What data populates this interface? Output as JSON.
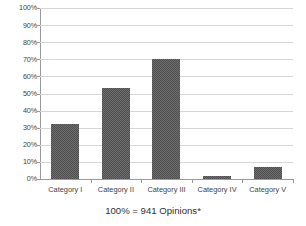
{
  "chart_data": {
    "type": "bar",
    "title": "",
    "subtitle": "",
    "xlabel": "",
    "ylabel": "",
    "categories": [
      "Category I",
      "Category II",
      "Category III",
      "Category IV",
      "Category V"
    ],
    "values": [
      32,
      53.5,
      70,
      1.5,
      7
    ],
    "value_labels": [
      "32%",
      "54%",
      "70%",
      "2%",
      "7%"
    ],
    "ylim": [
      0,
      100
    ],
    "ytick_values": [
      0,
      10,
      20,
      30,
      40,
      50,
      60,
      70,
      80,
      90,
      100
    ],
    "ytick_labels": [
      "0%",
      "10%",
      "20%",
      "30%",
      "40%",
      "50%",
      "60%",
      "70%",
      "80%",
      "90%",
      "100%"
    ],
    "grid": true,
    "grid_axis": "y",
    "legend": false,
    "legend_position": "none",
    "annotations": [
      "100% = 941 Opinions*"
    ],
    "bar_fill_color": "#6d6d6d",
    "bar_pattern": "checker-dither",
    "gridline_color": "#d6d6d6",
    "axis_color": "#9a9a9a",
    "background_color": "#ffffff"
  },
  "caption": {
    "text": "100% = 941 Opinions*"
  }
}
